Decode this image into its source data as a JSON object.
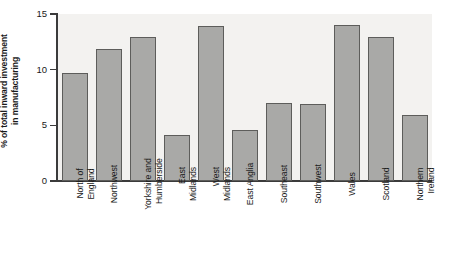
{
  "chart_data": {
    "type": "bar",
    "title": "",
    "xlabel": "",
    "ylabel": "% of total inward investment in manufacturing",
    "ylabel_lines": [
      "% of total inward investment",
      "in manufacturing"
    ],
    "ylim": [
      0,
      15
    ],
    "yticks": [
      0,
      5,
      10,
      15
    ],
    "ytick_labels": [
      "0",
      "5",
      "10",
      "15"
    ],
    "grid": false,
    "legend": null,
    "bar_color": "#a9a9a7",
    "bar_edge_color": "#5d5d5b",
    "plot_background": "#f3f2f0",
    "axis_color": "#3b3b3b",
    "categories": [
      "North of England",
      "Northwest",
      "Yorkshire and Humberside",
      "East Midlands",
      "West Midlands",
      "East Anglia",
      "Southeast",
      "Southwest",
      "Wales",
      "Scotland",
      "Northern Ireland"
    ],
    "category_label_lines": [
      [
        "North of",
        "England"
      ],
      [
        "Northwest"
      ],
      [
        "Yorkshire and",
        "Humberside"
      ],
      [
        "East",
        "Midlands"
      ],
      [
        "West",
        "Midlands"
      ],
      [
        "East Anglia"
      ],
      [
        "Southeast"
      ],
      [
        "Southwest"
      ],
      [
        "Wales"
      ],
      [
        "Scotland"
      ],
      [
        "Northern",
        "Ireland"
      ]
    ],
    "values": [
      9.7,
      11.9,
      12.9,
      4.1,
      13.9,
      4.6,
      7.0,
      6.9,
      14.0,
      12.9,
      5.9
    ]
  }
}
